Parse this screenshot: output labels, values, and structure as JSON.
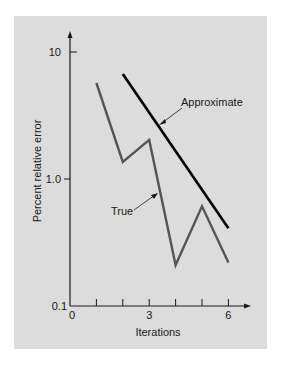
{
  "chart_data": {
    "type": "line",
    "title": "",
    "xlabel": "Iterations",
    "ylabel": "Percent relative error",
    "yscale": "log",
    "xlim": [
      0,
      6.8
    ],
    "ylim": [
      0.1,
      10
    ],
    "x_ticks": [
      0,
      1,
      2,
      3,
      4,
      5,
      6
    ],
    "x_tick_labels": [
      {
        "value": 0,
        "label": "0"
      },
      {
        "value": 3,
        "label": "3"
      },
      {
        "value": 6,
        "label": "6"
      }
    ],
    "y_tick_labels": [
      {
        "value": 10,
        "label": "10"
      },
      {
        "value": 1.0,
        "label": "1.0"
      },
      {
        "value": 0.1,
        "label": "0.1"
      }
    ],
    "grid": false,
    "legend": "none",
    "series": [
      {
        "name": "True",
        "color": "#555555",
        "x": [
          1,
          2,
          3,
          4,
          5,
          6
        ],
        "values": [
          5.7,
          1.36,
          2.03,
          0.21,
          0.61,
          0.22
        ]
      },
      {
        "name": "Approximate",
        "color": "#000000",
        "x": [
          2,
          6
        ],
        "values": [
          6.7,
          0.41
        ]
      }
    ],
    "annotations": [
      {
        "text": "Approximate",
        "target_series": "Approximate",
        "target_x": 3.4
      },
      {
        "text": "True",
        "target_series": "True",
        "target_x": 3.3
      }
    ]
  },
  "colors": {
    "panel": "#dcdcdc",
    "axis": "#1a1a1a"
  }
}
